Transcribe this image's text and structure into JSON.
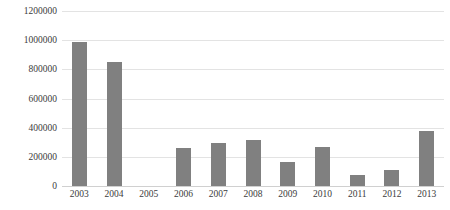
{
  "chart_data": {
    "type": "bar",
    "title": "",
    "subtitle": "",
    "xlabel": "",
    "ylabel": "",
    "categories": [
      "2003",
      "2004",
      "2005",
      "2006",
      "2007",
      "2008",
      "2009",
      "2010",
      "2011",
      "2012",
      "2013"
    ],
    "values": [
      985000,
      850000,
      0,
      260000,
      295000,
      315000,
      165000,
      265000,
      75000,
      110000,
      375000
    ],
    "ylim": [
      0,
      1200000
    ],
    "ytick_labels": [
      "0",
      "200000",
      "400000",
      "600000",
      "800000",
      "1000000",
      "1200000"
    ],
    "ytick_values": [
      0,
      200000,
      400000,
      600000,
      800000,
      1000000,
      1200000
    ],
    "grid": true,
    "legend": false,
    "legend_position": "none",
    "series_name": "",
    "colors": {
      "bar": "#808080",
      "gridline": "#e3e3e3",
      "baseline": "#d0d0d0",
      "tick_label": "#3b3b3b",
      "background": "#ffffff"
    }
  }
}
